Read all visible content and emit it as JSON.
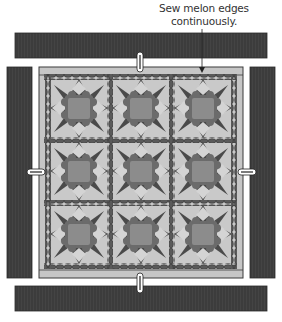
{
  "annotation": {
    "line1": "Sew melon edges",
    "line2": "continuously."
  },
  "colors": {
    "binding_strip": "#3c3c3c",
    "quilt_border": "#c6c6c6",
    "block_background": "#c9c9c9",
    "star_points": "#4a4a4a",
    "star_center": "#8c8c8c",
    "center_scallop": "#6b6b6b",
    "melon_chain": "#5a5a5a",
    "outline": "#3a3a3a",
    "pin": "#ffffff"
  },
  "quilt": {
    "rows": 3,
    "cols": 3,
    "block_type": "star block with melon chain sashing"
  },
  "strips": [
    {
      "position": "top"
    },
    {
      "position": "bottom"
    },
    {
      "position": "left"
    },
    {
      "position": "right"
    }
  ],
  "pins": [
    {
      "position": "top"
    },
    {
      "position": "bottom"
    },
    {
      "position": "left"
    },
    {
      "position": "right"
    }
  ]
}
